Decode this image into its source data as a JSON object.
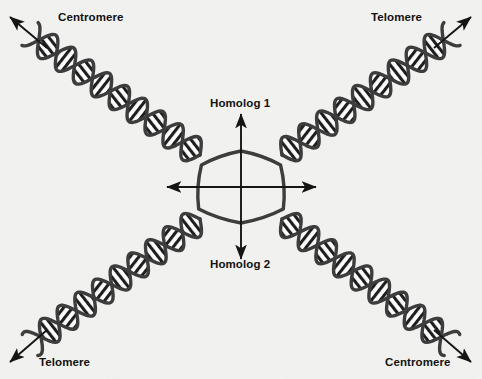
{
  "figure": {
    "background_color": "#f2f2f0",
    "ink_color": "#111111",
    "helix_backbone_color": "#3a3a3a",
    "helix_rung_color": "#1a1a1a"
  },
  "labels": {
    "centromere_top_left": "Centromere",
    "telomere_top_right": "Telomere",
    "telomere_bottom_left": "Telomere",
    "centromere_bottom_right": "Centromere",
    "homolog_1": "Homolog 1",
    "homolog_2": "Homolog 2"
  },
  "icons": {
    "arrow_up": "arrow-up-icon",
    "arrow_down": "arrow-down-icon",
    "arrow_left": "arrow-left-icon",
    "arrow_right": "arrow-right-icon",
    "arrow_up_left": "arrow-up-left-icon",
    "arrow_up_right": "arrow-up-right-icon",
    "arrow_down_left": "arrow-down-left-icon",
    "arrow_down_right": "arrow-down-right-icon"
  },
  "geometry": {
    "center": {
      "x": 241,
      "y": 187
    },
    "axis_arrows": {
      "vertical": {
        "x": 241,
        "top_y": 114,
        "bottom_y": 259
      },
      "horizontal": {
        "y": 187,
        "left_x": 167,
        "right_x": 316
      }
    },
    "arms": [
      {
        "name": "upper-left-arm",
        "label": "Centromere",
        "from": {
          "x": 200,
          "y": 155
        },
        "to": {
          "x": 30,
          "y": 34
        }
      },
      {
        "name": "upper-right-arm",
        "label": "Telomere",
        "from": {
          "x": 282,
          "y": 155
        },
        "to": {
          "x": 452,
          "y": 34
        }
      },
      {
        "name": "lower-left-arm",
        "label": "Telomere",
        "from": {
          "x": 200,
          "y": 219
        },
        "to": {
          "x": 30,
          "y": 345
        }
      },
      {
        "name": "lower-right-arm",
        "label": "Centromere",
        "from": {
          "x": 282,
          "y": 219
        },
        "to": {
          "x": 452,
          "y": 345
        }
      }
    ],
    "corner_arrows": [
      {
        "name": "top-left-arrow",
        "from": {
          "x": 47,
          "y": 48
        },
        "to": {
          "x": 10,
          "y": 17
        }
      },
      {
        "name": "top-right-arrow",
        "from": {
          "x": 434,
          "y": 48
        },
        "to": {
          "x": 471,
          "y": 17
        }
      },
      {
        "name": "bottom-left-arrow",
        "from": {
          "x": 47,
          "y": 330
        },
        "to": {
          "x": 10,
          "y": 362
        }
      },
      {
        "name": "bottom-right-arrow",
        "from": {
          "x": 434,
          "y": 330
        },
        "to": {
          "x": 471,
          "y": 362
        }
      }
    ]
  }
}
